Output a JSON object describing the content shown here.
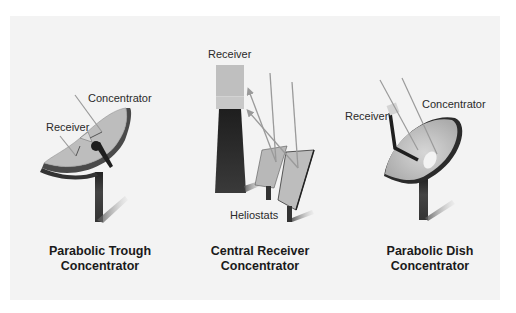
{
  "diagrams": [
    {
      "id": "trough",
      "title_line1": "Parabolic Trough",
      "title_line2": "Concentrator",
      "labels": {
        "concentrator": "Concentrator",
        "receiver": "Receiver"
      }
    },
    {
      "id": "central",
      "title_line1": "Central Receiver",
      "title_line2": "Concentrator",
      "labels": {
        "receiver": "Receiver",
        "heliostats": "Heliostats"
      }
    },
    {
      "id": "dish",
      "title_line1": "Parabolic Dish",
      "title_line2": "Concentrator",
      "labels": {
        "receiver": "Receiver",
        "concentrator": "Concentrator"
      }
    }
  ],
  "colors": {
    "panel_bg": "#f3f3f3",
    "reflector_light": "#bdbdbd",
    "reflector_dark": "#555555",
    "structure": "#2e2e2e",
    "ray": "#9a9a9a"
  }
}
